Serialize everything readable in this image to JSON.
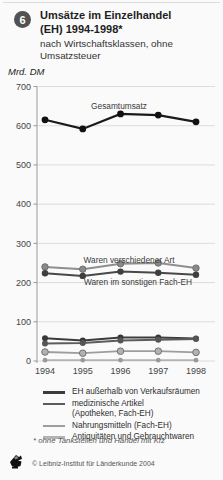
{
  "header": {
    "badge": "6",
    "title_line1": "Umsätze im Einzelhandel",
    "title_line2": "(EH) 1994-1998*",
    "subtitle_line1": "nach Wirtschaftsklassen, ohne",
    "subtitle_line2": "Umsatzsteuer",
    "unit_label": "Mrd. DM"
  },
  "chart_data": {
    "type": "line",
    "ylabel": "Mrd. DM",
    "xlabel": "",
    "x": [
      1994,
      1995,
      1996,
      1997,
      1998
    ],
    "ylim": [
      0,
      700
    ],
    "ytick_step": 100,
    "grid": true,
    "legend_position": "bottom",
    "series": [
      {
        "name": "Gesamtumsatz",
        "values": [
          615,
          592,
          630,
          627,
          610
        ],
        "color": "#1a1a1a",
        "width": 2.2,
        "marker": 3.4,
        "marker_fill": "#111111"
      },
      {
        "name": "Waren verschiedener Art",
        "values": [
          240,
          234,
          248,
          250,
          237
        ],
        "color": "#8e8e8e",
        "width": 2,
        "marker": 3.2,
        "marker_fill": "#8a8a8a",
        "marker_stroke": "#6d6d6d"
      },
      {
        "name": "Waren im sonstigen Fach-EH",
        "values": [
          224,
          217,
          228,
          225,
          220
        ],
        "color": "#484848",
        "width": 2,
        "marker": 3.2,
        "marker_fill": "#3f3f3f"
      },
      {
        "name": "EH außerhalb von Verkaufsräumen",
        "values": [
          58,
          52,
          60,
          60,
          57
        ],
        "color": "#3c3c3c",
        "width": 2,
        "marker": 3,
        "marker_fill": "#383838"
      },
      {
        "name": "medizinische Artikel (Apotheken, Fach-EH)",
        "values": [
          45,
          46,
          52,
          54,
          56
        ],
        "color": "#5c5c5c",
        "width": 2,
        "marker": 3,
        "marker_fill": "#555555"
      },
      {
        "name": "Nahrungsmitteln (Fach-EH)",
        "values": [
          23,
          20,
          25,
          25,
          22
        ],
        "color": "#9d9d9d",
        "width": 1.8,
        "marker": 3.3,
        "marker_fill": "#b2b2b2",
        "marker_stroke": "#727272"
      },
      {
        "name": "Antiquitäten und Gebrauchtwaren",
        "values": [
          2,
          2,
          2,
          2,
          2
        ],
        "color": "#b3b3b3",
        "width": 1.8,
        "marker": 2.4,
        "marker_fill": "#9a9a9a"
      }
    ],
    "annotations": [
      {
        "text": "Gesamtumsatz",
        "x": 119,
        "y": 29
      },
      {
        "text": "Waren verschiedener Art",
        "x": 129,
        "y": 183
      },
      {
        "text": "Waren im sonstigen Fach-EH",
        "x": 138,
        "y": 205
      }
    ]
  },
  "legend": {
    "items": [
      {
        "label": "EH außerhalb von Verkaufsräumen",
        "label2": "",
        "color": "#3c3c3c"
      },
      {
        "label": "medizinische Artikel",
        "label2": "(Apotheken, Fach-EH)",
        "color": "#5c5c5c"
      },
      {
        "label": "Nahrungsmitteln (Fach-EH)",
        "label2": "",
        "color": "#9d9d9d"
      },
      {
        "label": "Antiquitäten und Gebrauchtwaren",
        "label2": "",
        "color": "#b3b3b3"
      }
    ]
  },
  "footnote": "* ohne Tankstellen und Handel mit Kfz",
  "footer": {
    "copyright": "© Leibniz-Institut für Länderkunde 2004"
  }
}
